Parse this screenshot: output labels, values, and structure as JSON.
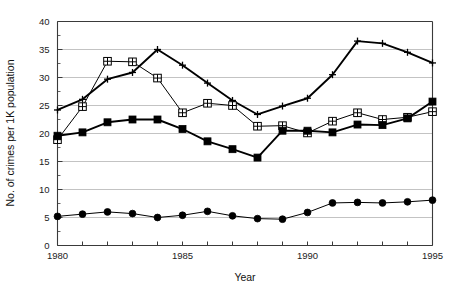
{
  "chart_data": {
    "type": "line",
    "title": "",
    "xlabel": "Year",
    "ylabel": "No. of crimes per 1K population",
    "xlim": [
      1980,
      1995
    ],
    "ylim": [
      0,
      40
    ],
    "ytick_step": 5,
    "ytick_minor_step": 2.5,
    "xtick_step": 1,
    "xtick_label_step": 5,
    "grid": "horizontal",
    "legend": "none",
    "x": [
      1980,
      1981,
      1982,
      1983,
      1984,
      1985,
      1986,
      1987,
      1988,
      1989,
      1990,
      1991,
      1992,
      1993,
      1994,
      1995
    ],
    "categories": [
      "1980",
      "1981",
      "1982",
      "1983",
      "1984",
      "1985",
      "1986",
      "1987",
      "1988",
      "1989",
      "1990",
      "1991",
      "1992",
      "1993",
      "1994",
      "1995"
    ],
    "xtick_labels": [
      "1980",
      "1985",
      "1990",
      "1995"
    ],
    "ytick_labels": [
      "0",
      "5",
      "10",
      "15",
      "20",
      "25",
      "30",
      "35",
      "40"
    ],
    "ytick_values": [
      0,
      5,
      10,
      15,
      20,
      25,
      30,
      35,
      40
    ],
    "series": [
      {
        "name": "series-plus",
        "marker": "plus",
        "line": "thick",
        "values": [
          24.2,
          26.1,
          29.7,
          30.9,
          35.0,
          32.2,
          29.0,
          25.9,
          23.4,
          24.9,
          26.3,
          30.5,
          36.5,
          36.1,
          34.5,
          32.6
        ]
      },
      {
        "name": "series-open-square",
        "marker": "cross-in-square",
        "line": "thin",
        "values": [
          18.9,
          24.8,
          32.9,
          32.8,
          29.9,
          23.7,
          25.4,
          25.0,
          21.3,
          21.4,
          20.1,
          22.2,
          23.7,
          22.5,
          22.9,
          23.9
        ]
      },
      {
        "name": "series-filled-square",
        "marker": "filled-square",
        "line": "thick",
        "values": [
          19.6,
          20.2,
          22.0,
          22.5,
          22.5,
          20.8,
          18.6,
          17.2,
          15.7,
          20.5,
          20.5,
          20.2,
          21.6,
          21.5,
          22.7,
          25.7
        ]
      },
      {
        "name": "series-filled-circle",
        "marker": "filled-circle",
        "line": "thin",
        "values": [
          5.2,
          5.6,
          6.0,
          5.7,
          5.0,
          5.4,
          6.1,
          5.3,
          4.8,
          4.7,
          5.9,
          7.6,
          7.7,
          7.6,
          7.8,
          8.1
        ]
      }
    ]
  },
  "colors": {
    "ink": "#000000",
    "axis": "#3a3a3a",
    "grid": "#9a9a9a",
    "background": "#ffffff"
  }
}
